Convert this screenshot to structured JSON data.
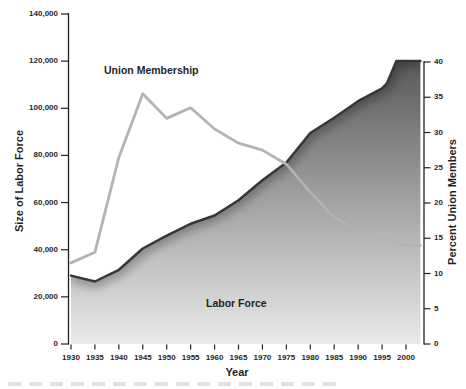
{
  "figure": {
    "union_label": "Union Membership",
    "labor_label": "Labor Force"
  },
  "axes": {
    "left": {
      "title": "Size of Labor Force",
      "ticks": [
        "140,000",
        "120,000",
        "100,000",
        "80,000",
        "60,000",
        "40,000",
        "20,000",
        "0"
      ]
    },
    "right": {
      "title": "Percent Union Members",
      "ticks": [
        "40",
        "35",
        "30",
        "25",
        "20",
        "15",
        "10",
        "5",
        "0"
      ]
    },
    "x": {
      "title": "Year",
      "ticks": [
        "1930",
        "1935",
        "1940",
        "1945",
        "1950",
        "1955",
        "1960",
        "1965",
        "1970",
        "1975",
        "1980",
        "1985",
        "1990",
        "1995",
        "2000"
      ]
    }
  },
  "colors": {
    "axis": "#231f20",
    "text": "#1f1f1f",
    "labor_line": "#36363b",
    "union_line": "#b3b3b3",
    "area_gradient": [
      "#575757",
      "#909090",
      "#c2c2c2",
      "#e9e9e9"
    ],
    "background": "#ffffff"
  },
  "chart_data": {
    "type": "area",
    "title": "",
    "xlabel": "Year",
    "ylabel_left": "Size of Labor Force",
    "ylabel_right": "Percent Union Members",
    "xlim": [
      1930,
      2003
    ],
    "ylim_left": [
      0,
      140000
    ],
    "ylim_right": [
      0,
      40
    ],
    "grid": false,
    "legend": "inline-labels",
    "series": [
      {
        "name": "Labor Force",
        "style": "area-gradient",
        "axis": "left",
        "units": "thousands of workers",
        "x": [
          1930,
          1935,
          1940,
          1945,
          1950,
          1955,
          1960,
          1965,
          1970,
          1975,
          1980,
          1985,
          1990,
          1995,
          1996,
          1998,
          2003
        ],
        "values": [
          29000,
          26500,
          31500,
          40500,
          46000,
          51000,
          54500,
          61000,
          69500,
          77000,
          89500,
          96000,
          103000,
          108500,
          110500,
          120000,
          120000
        ]
      },
      {
        "name": "Union Membership",
        "style": "line",
        "axis": "right",
        "units": "percent of labor force",
        "x": [
          1930,
          1935,
          1940,
          1945,
          1950,
          1955,
          1960,
          1965,
          1970,
          1975,
          1980,
          1985,
          1990,
          1995,
          2000,
          2003
        ],
        "values": [
          11.5,
          13,
          26.5,
          35.5,
          32,
          33.5,
          30.5,
          28.5,
          27.5,
          25.5,
          21.5,
          18,
          16,
          15,
          14,
          14
        ]
      }
    ]
  }
}
